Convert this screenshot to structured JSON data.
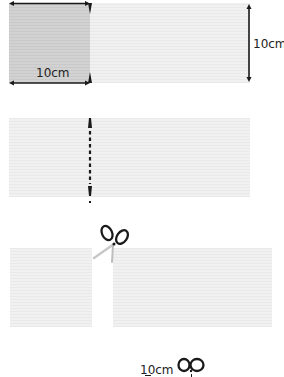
{
  "steps": [
    {
      "name": "measure",
      "width_label": "10cm",
      "height_label": "10cm"
    },
    {
      "name": "mark-cut-line"
    },
    {
      "name": "cut",
      "tool_icon": "scissors-icon"
    },
    {
      "name": "repeat",
      "label": "10cm",
      "tool_icon": "scissors-icon"
    }
  ],
  "colors": {
    "strip": "#eeeeee",
    "square": "#cecece",
    "ink": "#1a1a1a"
  }
}
